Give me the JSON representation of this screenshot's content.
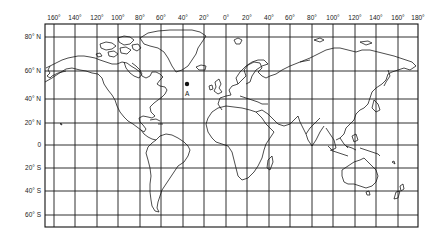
{
  "map": {
    "projection": "Mercator",
    "frame": {
      "left": 45,
      "top": 24,
      "right": 418,
      "bottom": 227
    },
    "longitude_labels": [
      {
        "text": "160°",
        "x": 54
      },
      {
        "text": "140°",
        "x": 75
      },
      {
        "text": "120°",
        "x": 97
      },
      {
        "text": "100°",
        "x": 118
      },
      {
        "text": "80°",
        "x": 140
      },
      {
        "text": "60°",
        "x": 161
      },
      {
        "text": "40°",
        "x": 183
      },
      {
        "text": "20°",
        "x": 204
      },
      {
        "text": "0°",
        "x": 226
      },
      {
        "text": "20°",
        "x": 247
      },
      {
        "text": "40°",
        "x": 269
      },
      {
        "text": "60°",
        "x": 290
      },
      {
        "text": "80°",
        "x": 312
      },
      {
        "text": "100°",
        "x": 333
      },
      {
        "text": "120°",
        "x": 355
      },
      {
        "text": "140°",
        "x": 376
      },
      {
        "text": "160°",
        "x": 398
      },
      {
        "text": "180°",
        "x": 418
      }
    ],
    "latitude_labels": [
      {
        "text": "80° N",
        "y": 37
      },
      {
        "text": "60° N",
        "y": 71
      },
      {
        "text": "40° N",
        "y": 99
      },
      {
        "text": "20° N",
        "y": 123
      },
      {
        "text": "0",
        "y": 145
      },
      {
        "text": "20° S",
        "y": 168
      },
      {
        "text": "40° S",
        "y": 191
      },
      {
        "text": "60° S",
        "y": 215
      }
    ],
    "marker": {
      "label": "A",
      "x": 187,
      "y": 84,
      "description": "point in North Atlantic Ocean"
    },
    "colors": {
      "line": "#111111",
      "background": "#ffffff",
      "text": "#222222"
    }
  }
}
